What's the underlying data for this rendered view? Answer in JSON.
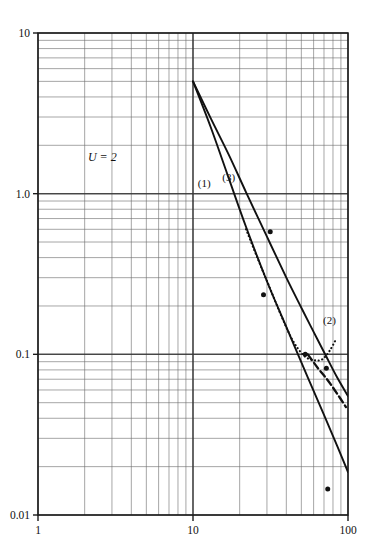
{
  "chart_data": {
    "type": "line",
    "title": "",
    "subtitle": "",
    "xlabel": "",
    "ylabel": "",
    "xscale": "log",
    "yscale": "log",
    "xlim": [
      1,
      100
    ],
    "ylim": [
      0.01,
      10
    ],
    "grid": true,
    "grid_minor": true,
    "legend": "inline-curve-labels",
    "legend_position": "on-plot",
    "x_tick_labels": [
      "1",
      "10",
      "100"
    ],
    "x_tick_values": [
      1,
      10,
      100
    ],
    "y_tick_labels": [
      "10",
      "1.0",
      "0.1",
      "0.01"
    ],
    "y_tick_values": [
      10,
      1.0,
      0.1,
      0.01
    ],
    "annotations": [
      {
        "text": "U = 2",
        "x": 2.6,
        "y": 1.6,
        "style": "italic"
      },
      {
        "text": "(1)",
        "x": 11.8,
        "y": 1.1,
        "style": "curve-label"
      },
      {
        "text": "(3)",
        "x": 17.0,
        "y": 1.2,
        "style": "curve-label"
      },
      {
        "text": "(2)",
        "x": 76.0,
        "y": 0.155,
        "style": "curve-label"
      }
    ],
    "series": [
      {
        "name": "(1)",
        "style": "solid",
        "points": [
          [
            10.0,
            5.0
          ],
          [
            13.0,
            2.6
          ],
          [
            17.0,
            1.25
          ],
          [
            22.0,
            0.62
          ],
          [
            30.0,
            0.285
          ],
          [
            40.0,
            0.148
          ],
          [
            55.0,
            0.072
          ],
          [
            70.0,
            0.042
          ],
          [
            85.0,
            0.027
          ],
          [
            100.0,
            0.0185
          ]
        ]
      },
      {
        "name": "(3)",
        "style": "solid",
        "points": [
          [
            10.0,
            5.0
          ],
          [
            13.0,
            2.95
          ],
          [
            17.0,
            1.75
          ],
          [
            22.0,
            1.02
          ],
          [
            30.0,
            0.54
          ],
          [
            40.0,
            0.3
          ],
          [
            50.0,
            0.195
          ],
          [
            60.0,
            0.138
          ],
          [
            72.0,
            0.098
          ],
          [
            85.0,
            0.072
          ],
          [
            100.0,
            0.055
          ]
        ]
      },
      {
        "name": "(2)",
        "style": "dotted",
        "points": [
          [
            22.0,
            0.6
          ],
          [
            26.0,
            0.4
          ],
          [
            31.0,
            0.265
          ],
          [
            37.0,
            0.175
          ],
          [
            44.0,
            0.122
          ],
          [
            52.0,
            0.098
          ],
          [
            60.0,
            0.092
          ],
          [
            68.0,
            0.093
          ],
          [
            76.0,
            0.105
          ],
          [
            84.0,
            0.125
          ]
        ]
      },
      {
        "name": "(2)-tail",
        "style": "dashed",
        "points": [
          [
            55.0,
            0.1
          ],
          [
            64.0,
            0.082
          ],
          [
            74.0,
            0.069
          ],
          [
            85.0,
            0.057
          ],
          [
            97.0,
            0.047
          ]
        ]
      }
    ],
    "data_points": [
      {
        "x": 31.5,
        "y": 0.58,
        "marker": "filled-circle"
      },
      {
        "x": 28.5,
        "y": 0.235,
        "marker": "filled-circle"
      },
      {
        "x": 53.0,
        "y": 0.1,
        "marker": "filled-circle"
      },
      {
        "x": 72.5,
        "y": 0.082,
        "marker": "filled-circle"
      },
      {
        "x": 74.0,
        "y": 0.0145,
        "marker": "filled-circle"
      }
    ]
  },
  "colors": {
    "background": "#ffffff",
    "axis": "#1a1a1a",
    "grid_major": "#3a3a3a",
    "grid_minor": "#6e6e6e",
    "curve": "#111111",
    "text": "#111111"
  },
  "labels": {
    "y_top": "10",
    "y_mid_high": "1.0",
    "y_mid_low": "0.1",
    "y_bottom": "0.01",
    "x_left": "1",
    "x_mid": "10",
    "x_right": "100",
    "annotation_u": "U = 2",
    "curve_1": "(1)",
    "curve_2": "(2)",
    "curve_3": "(3)"
  }
}
